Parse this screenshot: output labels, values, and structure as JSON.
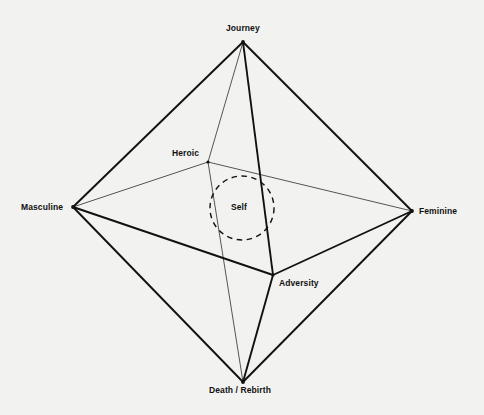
{
  "diagram": {
    "type": "octahedron-archetype-diagram",
    "background_color": "#f2f2f0",
    "line_color": "#111111",
    "text_color": "#111111",
    "vertices": [
      {
        "id": "journey",
        "label": "Journey",
        "x": 243,
        "y": 42,
        "label_anchor": "above"
      },
      {
        "id": "masculine",
        "label": "Masculine",
        "x": 73,
        "y": 207,
        "label_anchor": "left"
      },
      {
        "id": "feminine",
        "label": "Feminine",
        "x": 412,
        "y": 211,
        "label_anchor": "right"
      },
      {
        "id": "death",
        "label": "Death / Rebirth",
        "x": 243,
        "y": 382,
        "label_anchor": "below"
      },
      {
        "id": "heroic",
        "label": "Heroic",
        "x": 208,
        "y": 162,
        "label_anchor": "left"
      },
      {
        "id": "adversity",
        "label": "Adversity",
        "x": 273,
        "y": 275,
        "label_anchor": "right"
      }
    ],
    "center_node": {
      "id": "self",
      "label": "Self",
      "x": 242,
      "y": 208,
      "radius": 32,
      "stroke_style": "dashed"
    },
    "edges": [
      {
        "from": "journey",
        "to": "masculine",
        "weight": "thick"
      },
      {
        "from": "journey",
        "to": "feminine",
        "weight": "thick"
      },
      {
        "from": "journey",
        "to": "adversity",
        "weight": "thick"
      },
      {
        "from": "journey",
        "to": "heroic",
        "weight": "thin"
      },
      {
        "from": "masculine",
        "to": "death",
        "weight": "thick"
      },
      {
        "from": "masculine",
        "to": "adversity",
        "weight": "thick"
      },
      {
        "from": "masculine",
        "to": "heroic",
        "weight": "thin"
      },
      {
        "from": "feminine",
        "to": "death",
        "weight": "thick"
      },
      {
        "from": "feminine",
        "to": "adversity",
        "weight": "thick"
      },
      {
        "from": "feminine",
        "to": "heroic",
        "weight": "thin"
      },
      {
        "from": "death",
        "to": "adversity",
        "weight": "thick"
      },
      {
        "from": "death",
        "to": "heroic",
        "weight": "thin"
      }
    ]
  },
  "labels": {
    "journey": "Journey",
    "masculine": "Masculine",
    "feminine": "Feminine",
    "death": "Death / Rebirth",
    "heroic": "Heroic",
    "adversity": "Adversity",
    "self": "Self"
  }
}
